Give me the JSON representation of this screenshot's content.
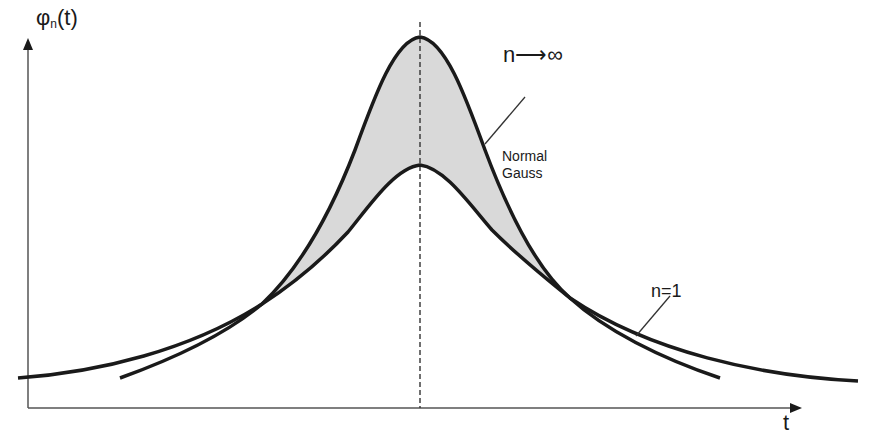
{
  "axes": {
    "y_label_base": "φ",
    "y_label_sub": "n",
    "y_label_arg": "(t)",
    "x_label": "t"
  },
  "curves": {
    "limit": {
      "label": "n⟶∞",
      "description_line1": "Normal",
      "description_line2": "Gauss"
    },
    "base": {
      "label": "n=1"
    }
  },
  "colors": {
    "curve": "#1a1a1a",
    "axis": "#555555",
    "fill": "#d9d9d9",
    "dash": "#333333",
    "background": "#ffffff"
  }
}
